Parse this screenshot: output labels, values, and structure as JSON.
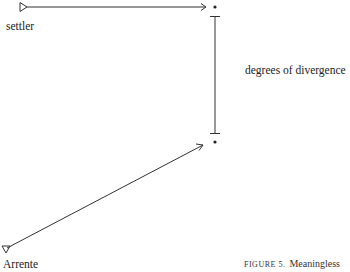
{
  "diagram": {
    "nodes": [
      {
        "id": "settler",
        "label": "settler",
        "marker": "triangle-right"
      },
      {
        "id": "arrente",
        "label": "Arrente",
        "marker": "triangle-down"
      },
      {
        "id": "top-point",
        "label": "",
        "marker": "dot"
      },
      {
        "id": "bottom-point",
        "label": "",
        "marker": "dot"
      }
    ],
    "edges": [
      {
        "from": "settler",
        "to": "top-point",
        "type": "arrow"
      },
      {
        "from": "arrente",
        "to": "bottom-point",
        "type": "arrow"
      },
      {
        "from": "top-point",
        "to": "bottom-point",
        "type": "range-bar",
        "label": "degrees of divergence"
      }
    ]
  },
  "labels": {
    "settler": "settler",
    "arrente": "Arrente",
    "divergence": "degrees of divergence"
  },
  "caption": {
    "figure": "FIGURE 5.",
    "text": "Meaningless"
  },
  "colors": {
    "line": "#333333",
    "text": "#222222"
  }
}
